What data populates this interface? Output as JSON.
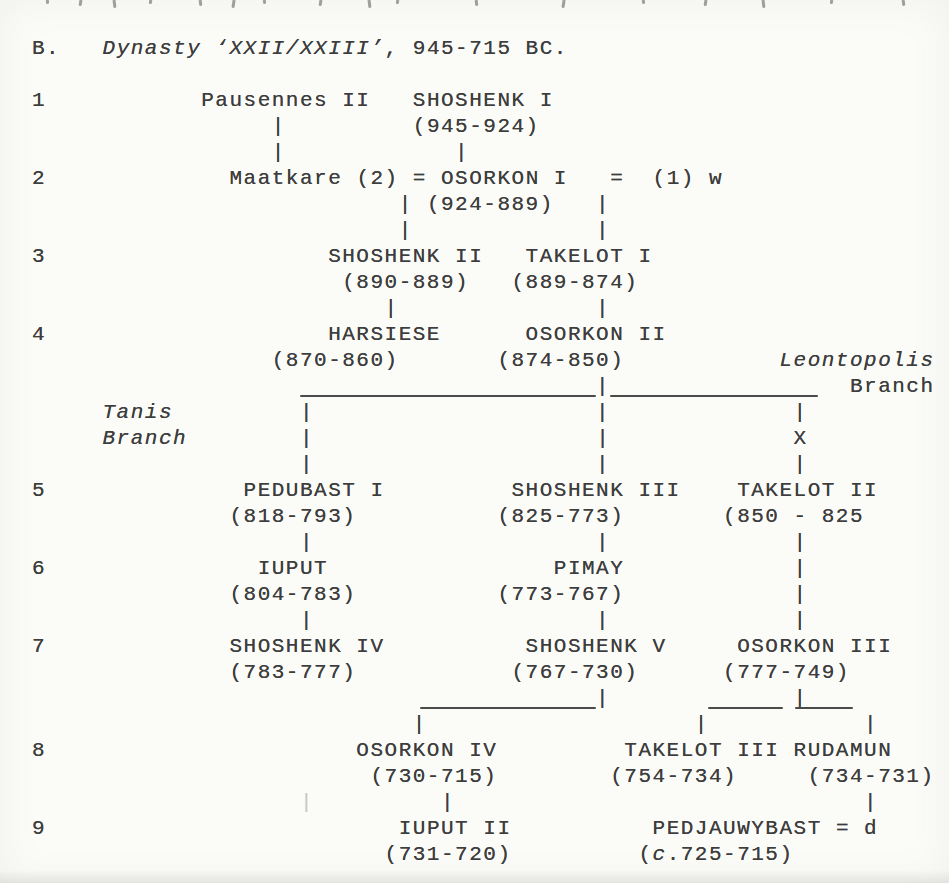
{
  "page": {
    "background": "#fbfbf8",
    "ink_color": "#3d3d3d",
    "rule_color": "#4a4a4a"
  },
  "header": {
    "section_letter": "B.",
    "section_title": "Dynasty ‘XXII/XXIII’",
    "section_date_range": ", 945-715 BC."
  },
  "tree": {
    "lines": [
      {
        "y": 36,
        "name": "section-heading",
        "segs": [
          {
            "c": 0,
            "t": "B.",
            "n": "section-letter"
          },
          {
            "c": 5,
            "t": "Dynasty ‘XXII/XXIII’",
            "it": true,
            "n": "section-title"
          },
          {
            "c": 25,
            "t": ", 945-715 BC.",
            "n": "section-date-range"
          }
        ]
      },
      {
        "y": 88,
        "name": "generation-row-1",
        "segs": [
          {
            "c": 0,
            "t": "1",
            "n": "generation-number"
          },
          {
            "c": 12,
            "t": "Pausennes II",
            "n": "person-name"
          },
          {
            "c": 27,
            "t": "SHOSHENK I",
            "n": "person-name"
          }
        ]
      },
      {
        "y": 114,
        "segs": [
          {
            "c": 17,
            "t": "|",
            "n": "descent-connector"
          },
          {
            "c": 27,
            "t": "(945-924)",
            "n": "reign-dates"
          }
        ]
      },
      {
        "y": 140,
        "segs": [
          {
            "c": 17,
            "t": "|",
            "n": "descent-connector"
          },
          {
            "c": 30,
            "t": "|",
            "n": "descent-connector"
          }
        ]
      },
      {
        "y": 166,
        "name": "generation-row-2",
        "segs": [
          {
            "c": 0,
            "t": "2",
            "n": "generation-number"
          },
          {
            "c": 14,
            "t": "Maatkare",
            "n": "person-name"
          },
          {
            "c": 23,
            "t": "(2)",
            "n": "marriage-order"
          },
          {
            "c": 27,
            "t": "=",
            "n": "marriage-sign"
          },
          {
            "c": 29,
            "t": "OSORKON I",
            "n": "person-name"
          },
          {
            "c": 41,
            "t": "=",
            "n": "marriage-sign"
          },
          {
            "c": 44,
            "t": "(1)",
            "n": "marriage-order"
          },
          {
            "c": 48,
            "t": "w",
            "n": "wife-abbrev"
          }
        ]
      },
      {
        "y": 192,
        "segs": [
          {
            "c": 26,
            "t": "|",
            "n": "descent-connector"
          },
          {
            "c": 28,
            "t": "(924-889)",
            "n": "reign-dates"
          },
          {
            "c": 40,
            "t": "|",
            "n": "descent-connector"
          }
        ]
      },
      {
        "y": 218,
        "segs": [
          {
            "c": 26,
            "t": "|",
            "n": "descent-connector"
          },
          {
            "c": 40,
            "t": "|",
            "n": "descent-connector"
          }
        ]
      },
      {
        "y": 244,
        "name": "generation-row-3",
        "segs": [
          {
            "c": 0,
            "t": "3",
            "n": "generation-number"
          },
          {
            "c": 21,
            "t": "SHOSHENK II",
            "n": "person-name"
          },
          {
            "c": 35,
            "t": "TAKELOT I",
            "n": "person-name"
          }
        ]
      },
      {
        "y": 270,
        "segs": [
          {
            "c": 22,
            "t": "(890-889)",
            "n": "reign-dates"
          },
          {
            "c": 34,
            "t": "(889-874)",
            "n": "reign-dates"
          }
        ]
      },
      {
        "y": 296,
        "segs": [
          {
            "c": 25,
            "t": "|",
            "n": "descent-connector"
          },
          {
            "c": 40,
            "t": "|",
            "n": "descent-connector"
          }
        ]
      },
      {
        "y": 322,
        "name": "generation-row-4",
        "segs": [
          {
            "c": 0,
            "t": "4",
            "n": "generation-number"
          },
          {
            "c": 21,
            "t": "HARSIESE",
            "n": "person-name"
          },
          {
            "c": 35,
            "t": "OSORKON II",
            "n": "person-name"
          }
        ]
      },
      {
        "y": 348,
        "segs": [
          {
            "c": 17,
            "t": "(870-860)",
            "n": "reign-dates"
          },
          {
            "c": 33,
            "t": "(874-850)",
            "n": "reign-dates"
          },
          {
            "c": 53,
            "t": "Leontopolis",
            "it": true,
            "n": "branch-label-leontopolis"
          }
        ]
      },
      {
        "y": 374,
        "segs": [
          {
            "c": 40,
            "t": "|",
            "n": "descent-connector"
          },
          {
            "c": 58,
            "t": "Branch",
            "n": "branch-label-leontopolis"
          }
        ]
      },
      {
        "y": 400,
        "segs": [
          {
            "c": 5,
            "t": "Tanis",
            "it": true,
            "n": "branch-label-tanis"
          },
          {
            "c": 19,
            "t": "|",
            "n": "descent-connector"
          },
          {
            "c": 40,
            "t": "|",
            "n": "descent-connector"
          },
          {
            "c": 54,
            "t": "|",
            "n": "descent-connector"
          }
        ]
      },
      {
        "y": 426,
        "segs": [
          {
            "c": 5,
            "t": "Branch",
            "it": true,
            "n": "branch-label-tanis"
          },
          {
            "c": 19,
            "t": "|",
            "n": "descent-connector"
          },
          {
            "c": 40,
            "t": "|",
            "n": "descent-connector"
          },
          {
            "c": 54,
            "t": "X",
            "n": "uncertain-link-marker"
          }
        ]
      },
      {
        "y": 452,
        "segs": [
          {
            "c": 19,
            "t": "|",
            "n": "descent-connector"
          },
          {
            "c": 40,
            "t": "|",
            "n": "descent-connector"
          },
          {
            "c": 54,
            "t": "|",
            "n": "descent-connector"
          }
        ]
      },
      {
        "y": 478,
        "name": "generation-row-5",
        "segs": [
          {
            "c": 0,
            "t": "5",
            "n": "generation-number"
          },
          {
            "c": 15,
            "t": "PEDUBAST I",
            "n": "person-name"
          },
          {
            "c": 34,
            "t": "SHOSHENK III",
            "n": "person-name"
          },
          {
            "c": 50,
            "t": "TAKELOT II",
            "n": "person-name"
          }
        ]
      },
      {
        "y": 504,
        "segs": [
          {
            "c": 14,
            "t": "(818-793)",
            "n": "reign-dates"
          },
          {
            "c": 33,
            "t": "(825-773)",
            "n": "reign-dates"
          },
          {
            "c": 49,
            "t": "(850 - 825",
            "n": "reign-dates"
          }
        ]
      },
      {
        "y": 530,
        "segs": [
          {
            "c": 19,
            "t": "|",
            "n": "descent-connector"
          },
          {
            "c": 40,
            "t": "|",
            "n": "descent-connector"
          },
          {
            "c": 54,
            "t": "|",
            "n": "descent-connector"
          }
        ]
      },
      {
        "y": 556,
        "name": "generation-row-6",
        "segs": [
          {
            "c": 0,
            "t": "6",
            "n": "generation-number"
          },
          {
            "c": 16,
            "t": "IUPUT",
            "n": "person-name"
          },
          {
            "c": 37,
            "t": "PIMAY",
            "n": "person-name"
          },
          {
            "c": 54,
            "t": "|",
            "n": "descent-connector"
          }
        ]
      },
      {
        "y": 582,
        "segs": [
          {
            "c": 14,
            "t": "(804-783)",
            "n": "reign-dates"
          },
          {
            "c": 33,
            "t": "(773-767)",
            "n": "reign-dates"
          },
          {
            "c": 54,
            "t": "|",
            "n": "descent-connector"
          }
        ]
      },
      {
        "y": 608,
        "segs": [
          {
            "c": 19,
            "t": "|",
            "n": "descent-connector"
          },
          {
            "c": 40,
            "t": "|",
            "n": "descent-connector"
          },
          {
            "c": 54,
            "t": "|",
            "n": "descent-connector"
          }
        ]
      },
      {
        "y": 634,
        "name": "generation-row-7",
        "segs": [
          {
            "c": 0,
            "t": "7",
            "n": "generation-number"
          },
          {
            "c": 14,
            "t": "SHOSHENK IV",
            "n": "person-name"
          },
          {
            "c": 35,
            "t": "SHOSHENK V",
            "n": "person-name"
          },
          {
            "c": 50,
            "t": "OSORKON III",
            "n": "person-name"
          }
        ]
      },
      {
        "y": 660,
        "segs": [
          {
            "c": 14,
            "t": "(783-777)",
            "n": "reign-dates"
          },
          {
            "c": 34,
            "t": "(767-730)",
            "n": "reign-dates"
          },
          {
            "c": 49,
            "t": "(777-749)",
            "n": "reign-dates"
          }
        ]
      },
      {
        "y": 686,
        "segs": [
          {
            "c": 40,
            "t": "|",
            "n": "descent-connector"
          },
          {
            "c": 54,
            "t": "|",
            "n": "descent-connector"
          }
        ]
      },
      {
        "y": 712,
        "segs": [
          {
            "c": 27,
            "t": "|",
            "n": "descent-connector"
          },
          {
            "c": 47,
            "t": "|",
            "n": "descent-connector"
          },
          {
            "c": 59,
            "t": "|",
            "n": "descent-connector"
          }
        ]
      },
      {
        "y": 738,
        "name": "generation-row-8",
        "segs": [
          {
            "c": 0,
            "t": "8",
            "n": "generation-number"
          },
          {
            "c": 23,
            "t": "OSORKON IV",
            "n": "person-name"
          },
          {
            "c": 42,
            "t": "TAKELOT III",
            "n": "person-name"
          },
          {
            "c": 54,
            "t": "RUDAMUN",
            "n": "person-name"
          }
        ]
      },
      {
        "y": 764,
        "segs": [
          {
            "c": 24,
            "t": "(730-715)",
            "n": "reign-dates"
          },
          {
            "c": 41,
            "t": "(754-734)",
            "n": "reign-dates"
          },
          {
            "c": 55,
            "t": "(734-731)",
            "n": "reign-dates"
          }
        ]
      },
      {
        "y": 790,
        "segs": [
          {
            "c": 19,
            "t": "|",
            "faint": true,
            "n": "scan-artifact-bar"
          },
          {
            "c": 29,
            "t": "|",
            "n": "descent-connector"
          },
          {
            "c": 59,
            "t": "|",
            "n": "descent-connector"
          }
        ]
      },
      {
        "y": 816,
        "name": "generation-row-9",
        "segs": [
          {
            "c": 0,
            "t": "9",
            "n": "generation-number"
          },
          {
            "c": 26,
            "t": "IUPUT II",
            "n": "person-name"
          },
          {
            "c": 44,
            "t": "PEDJAUWYBAST",
            "n": "person-name"
          },
          {
            "c": 57,
            "t": "=",
            "n": "marriage-sign"
          },
          {
            "c": 59,
            "t": "d",
            "n": "daughter-abbrev"
          }
        ]
      },
      {
        "y": 842,
        "segs": [
          {
            "c": 25,
            "t": "(731-720)",
            "n": "reign-dates"
          },
          {
            "c": 43,
            "t": "(",
            "n": "reign-dates"
          },
          {
            "c": 44,
            "t": "c",
            "it": true,
            "n": "circa-abbrev"
          },
          {
            "c": 45,
            "t": ".725-715)",
            "n": "reign-dates"
          }
        ]
      }
    ],
    "rules": [
      {
        "x1": 300,
        "x2": 596,
        "y": 395
      },
      {
        "x1": 610,
        "x2": 818,
        "y": 395
      },
      {
        "x1": 420,
        "x2": 596,
        "y": 707
      },
      {
        "x1": 708,
        "x2": 783,
        "y": 707
      },
      {
        "x1": 795,
        "x2": 853,
        "y": 707
      }
    ]
  },
  "top_edge_marks_x": [
    46,
    79,
    113,
    149,
    199,
    232,
    263,
    319,
    368,
    396,
    475,
    562,
    642,
    704,
    762,
    830,
    902
  ]
}
